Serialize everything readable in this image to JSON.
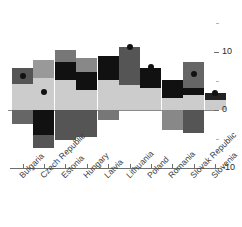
{
  "chart_data": {
    "type": "bar",
    "subtype": "stacked-bar-with-marker",
    "title": "",
    "xlabel": "",
    "ylabel": "",
    "ylim": [
      -10,
      13
    ],
    "y_ticks": [
      10,
      0,
      -10
    ],
    "y_tick_labels": [
      "10",
      "0",
      "-10"
    ],
    "minor_ticks": [
      15,
      5,
      -5
    ],
    "grid": false,
    "legend_position": "none",
    "axis_position": "right",
    "categories": [
      "Bulgaria",
      "Czech Republic",
      "Estonia",
      "Hungary",
      "Latvia",
      "Lithuania",
      "Poland",
      "Romania",
      "Slovak Republic",
      "Slovenia"
    ],
    "series": [
      {
        "name": "light-gray-component",
        "color": "#cccccc",
        "values": [
          4.5,
          5.5,
          5.2,
          3.4,
          5.2,
          4.3,
          3.8,
          2.0,
          2.6,
          1.7
        ]
      },
      {
        "name": "black-component",
        "color": "#111111",
        "values": [
          0,
          0,
          3.1,
          3.1,
          4.1,
          0,
          3.8,
          3.1,
          1.2,
          1.2
        ]
      },
      {
        "name": "dark-gray-component",
        "color": "#666666",
        "values": [
          2.8,
          0,
          0,
          0,
          0,
          6.6,
          0,
          0,
          0,
          0
        ]
      },
      {
        "name": "mid-gray-component",
        "color": "#999999",
        "values": [
          0,
          3.1,
          2.1,
          2.4,
          0,
          0,
          0,
          0,
          4.5,
          0
        ]
      },
      {
        "name": "negative-component",
        "color": "#666666",
        "values": [
          -2.4,
          -6.6,
          -5.2,
          -4.7,
          -1.7,
          0,
          0,
          -3.4,
          -4.0,
          0
        ]
      },
      {
        "name": "negative-black-component",
        "color": "#111111",
        "values": [
          0,
          -4.3,
          0,
          0,
          0,
          0,
          0,
          0,
          0,
          0
        ]
      }
    ],
    "markers": {
      "name": "total-marker",
      "shape": "circle",
      "color": "#111111",
      "values": [
        7.2,
        3.4,
        null,
        null,
        null,
        10.9,
        7.4,
        null,
        6.2,
        2.9
      ]
    },
    "bars": [
      {
        "category": "Bulgaria",
        "segments": [
          {
            "series": "dark-gray-component",
            "from": 4.5,
            "to": 7.2,
            "color": "#555555"
          },
          {
            "series": "light-gray-component",
            "from": 0,
            "to": 4.5,
            "color": "#cccccc"
          },
          {
            "series": "negative-component",
            "from": -2.4,
            "to": 0,
            "color": "#666666"
          }
        ],
        "marker": 5.9
      },
      {
        "category": "Czech Republic",
        "segments": [
          {
            "series": "mid-gray-component",
            "from": 5.5,
            "to": 8.6,
            "color": "#999999"
          },
          {
            "series": "light-gray-component",
            "from": 0,
            "to": 5.5,
            "color": "#cccccc"
          },
          {
            "series": "negative-black-component",
            "from": -4.3,
            "to": 0,
            "color": "#111111"
          },
          {
            "series": "negative-component",
            "from": -6.6,
            "to": -4.3,
            "color": "#555555"
          }
        ],
        "marker": 3.1
      },
      {
        "category": "Estonia",
        "segments": [
          {
            "series": "mid-gray-component",
            "from": 8.3,
            "to": 10.3,
            "color": "#777777"
          },
          {
            "series": "black-component",
            "from": 5.2,
            "to": 8.3,
            "color": "#111111"
          },
          {
            "series": "light-gray-component",
            "from": 0,
            "to": 5.2,
            "color": "#cccccc"
          },
          {
            "series": "negative-component",
            "from": -5.2,
            "to": 0,
            "color": "#555555"
          }
        ],
        "marker": null
      },
      {
        "category": "Hungary",
        "segments": [
          {
            "series": "mid-gray-component",
            "from": 6.6,
            "to": 9.0,
            "color": "#888888"
          },
          {
            "series": "black-component",
            "from": 3.4,
            "to": 6.6,
            "color": "#111111"
          },
          {
            "series": "light-gray-component",
            "from": 0,
            "to": 3.4,
            "color": "#cccccc"
          },
          {
            "series": "negative-component",
            "from": -4.7,
            "to": 0,
            "color": "#555555"
          }
        ],
        "marker": null
      },
      {
        "category": "Latvia",
        "segments": [
          {
            "series": "black-component",
            "from": 5.2,
            "to": 9.3,
            "color": "#111111"
          },
          {
            "series": "light-gray-component",
            "from": 0,
            "to": 5.2,
            "color": "#cccccc"
          },
          {
            "series": "negative-component",
            "from": -1.7,
            "to": 0,
            "color": "#777777"
          }
        ],
        "marker": null
      },
      {
        "category": "Lithuania",
        "segments": [
          {
            "series": "dark-gray-component",
            "from": 4.3,
            "to": 10.9,
            "color": "#555555"
          },
          {
            "series": "light-gray-component",
            "from": 0,
            "to": 4.3,
            "color": "#cccccc"
          }
        ],
        "marker": 10.9
      },
      {
        "category": "Poland",
        "segments": [
          {
            "series": "black-component",
            "from": 3.8,
            "to": 7.2,
            "color": "#111111"
          },
          {
            "series": "light-gray-component",
            "from": 0,
            "to": 3.8,
            "color": "#cccccc"
          }
        ],
        "marker": 7.4
      },
      {
        "category": "Romania",
        "segments": [
          {
            "series": "black-component",
            "from": 2.0,
            "to": 5.2,
            "color": "#111111"
          },
          {
            "series": "light-gray-component",
            "from": 0,
            "to": 2.0,
            "color": "#cccccc"
          },
          {
            "series": "negative-component",
            "from": -3.4,
            "to": 0,
            "color": "#888888"
          }
        ],
        "marker": null
      },
      {
        "category": "Slovak Republic",
        "segments": [
          {
            "series": "mid-gray-component",
            "from": 3.8,
            "to": 8.3,
            "color": "#666666"
          },
          {
            "series": "black-component",
            "from": 2.6,
            "to": 3.8,
            "color": "#111111"
          },
          {
            "series": "light-gray-component",
            "from": 0,
            "to": 2.6,
            "color": "#cccccc"
          },
          {
            "series": "negative-component",
            "from": -4.0,
            "to": 0,
            "color": "#555555"
          }
        ],
        "marker": 6.2
      },
      {
        "category": "Slovenia",
        "segments": [
          {
            "series": "black-component",
            "from": 1.7,
            "to": 2.9,
            "color": "#222222"
          },
          {
            "series": "light-gray-component",
            "from": 0,
            "to": 1.7,
            "color": "#cccccc"
          }
        ],
        "marker": 2.9
      }
    ]
  }
}
